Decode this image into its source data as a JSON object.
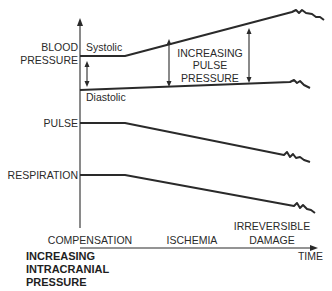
{
  "diagram": {
    "y_axis_labels": {
      "blood_pressure_line1": "BLOOD",
      "blood_pressure_line2": "PRESSURE",
      "pulse": "PULSE",
      "respiration": "RESPIRATION"
    },
    "series_labels": {
      "systolic": "Systolic",
      "diastolic": "Diastolic"
    },
    "annotation": {
      "line1": "INCREASING",
      "line2": "PULSE",
      "line3": "PRESSURE"
    },
    "phases": {
      "compensation": "COMPENSATION",
      "ischemia": "ISCHEMIA",
      "irreversible_line1": "IRREVERSIBLE",
      "irreversible_line2": "DAMAGE"
    },
    "x_axis_label": "TIME",
    "title": {
      "line1": "INCREASING",
      "line2": "INTRACRANIAL",
      "line3": "PRESSURE"
    },
    "colors": {
      "ink": "#2a2a2a",
      "background": "#ffffff"
    }
  }
}
